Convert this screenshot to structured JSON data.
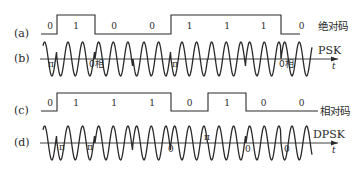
{
  "diagram": {
    "rows": [
      {
        "id": "a",
        "label": "(a)",
        "type": "digital",
        "name": "绝对码",
        "bits": [
          "0",
          "1",
          "0",
          "0",
          "1",
          "1",
          "1",
          "0"
        ]
      },
      {
        "id": "b",
        "label": "(b)",
        "type": "carrier",
        "name": "PSK",
        "axis_label": "t",
        "phase_labels": [
          {
            "text": "π",
            "x": 48,
            "y": 67
          },
          {
            "text": "0相",
            "x": 89,
            "y": 67
          },
          {
            "text": "π",
            "x": 172,
            "y": 67
          },
          {
            "text": "0相",
            "x": 279,
            "y": 67
          }
        ]
      },
      {
        "id": "c",
        "label": "(c)",
        "type": "digital",
        "name": "相对码",
        "bits": [
          "0",
          "1",
          "1",
          "1",
          "0",
          "1",
          "0",
          "0"
        ]
      },
      {
        "id": "d",
        "label": "(d)",
        "type": "carrier",
        "name": "DPSK",
        "axis_label": "t",
        "phase_labels": [
          {
            "text": "π",
            "x": 59,
            "y": 150
          },
          {
            "text": "π",
            "x": 87,
            "y": 150
          },
          {
            "text": "0",
            "x": 168,
            "y": 152
          },
          {
            "text": "π",
            "x": 204,
            "y": 140
          },
          {
            "text": "0",
            "x": 245,
            "y": 152
          },
          {
            "text": "0",
            "x": 284,
            "y": 152
          }
        ]
      }
    ],
    "colors": {
      "ink": "#2a2a2a",
      "background": "#ffffff"
    }
  }
}
